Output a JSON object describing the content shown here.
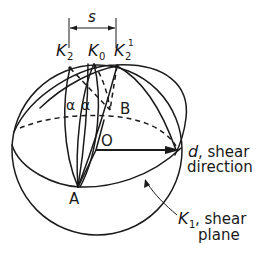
{
  "diagram": {
    "type": "crystallographic twinning sphere diagram",
    "labels": {
      "s": "s",
      "k2": "K",
      "k2_sub": "2",
      "k0": "K",
      "k0_sub": "0",
      "k2p": "K",
      "k2p_sub": "2",
      "k2p_sup": "1",
      "alpha1": "α",
      "alpha2": "α",
      "b": "B",
      "o": "O",
      "a": "A",
      "d": "d",
      "d_rest": ", shear",
      "d_line2": "direction",
      "k1": "K",
      "k1_sub": "1",
      "k1_rest": ", shear",
      "k1_line2": "plane"
    },
    "colors": {
      "ink": "#1a1a1a",
      "background": "#ffffff"
    }
  }
}
